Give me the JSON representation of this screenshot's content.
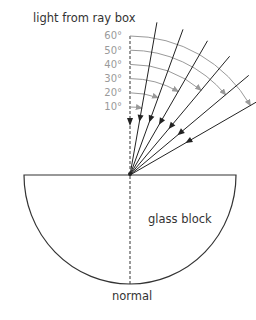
{
  "labels": {
    "source": "light from ray box",
    "block": "glass block",
    "normal": "normal"
  },
  "angles": [
    {
      "label": "10°",
      "deg": 10
    },
    {
      "label": "20°",
      "deg": 20
    },
    {
      "label": "30°",
      "deg": 30
    },
    {
      "label": "40°",
      "deg": 40
    },
    {
      "label": "50°",
      "deg": 50
    },
    {
      "label": "60°",
      "deg": 60
    }
  ],
  "colors": {
    "ray": "#222222",
    "arc": "#9a9a9a",
    "outline": "#333333"
  }
}
